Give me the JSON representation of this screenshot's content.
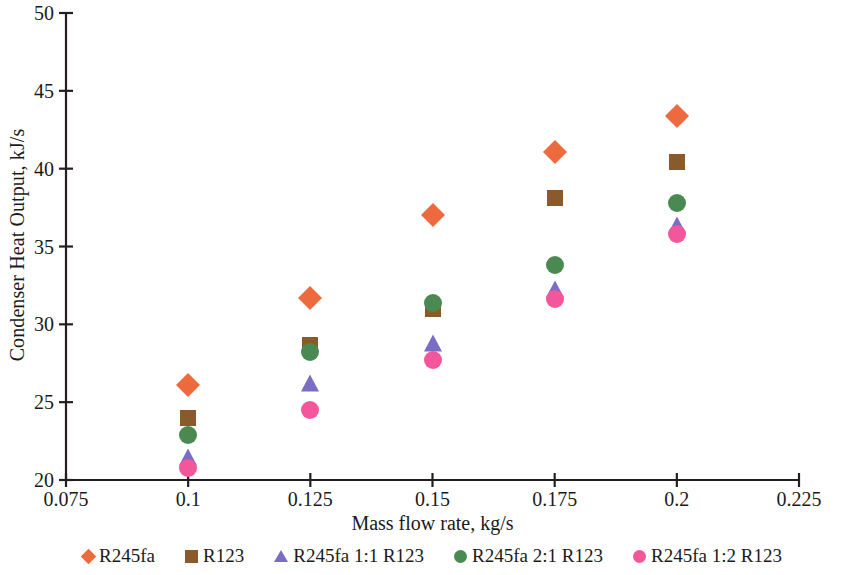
{
  "chart_data": {
    "type": "scatter",
    "title": "",
    "xlabel": "Mass flow rate, kg/s",
    "ylabel": "Condenser Heat Output, kJ/s",
    "xlim": [
      0.075,
      0.225
    ],
    "ylim": [
      20,
      50
    ],
    "xticks": [
      "0.075",
      "0.1",
      "0.125",
      "0.15",
      "0.175",
      "0.2",
      "0.225"
    ],
    "xtick_values": [
      0.075,
      0.1,
      0.125,
      0.15,
      0.175,
      0.2,
      0.225
    ],
    "yticks": [
      "50",
      "45",
      "40",
      "35",
      "30",
      "25",
      "20"
    ],
    "ytick_values": [
      50,
      45,
      40,
      35,
      30,
      25,
      20
    ],
    "grid": false,
    "legend_position": "bottom",
    "x": [
      0.1,
      0.125,
      0.15,
      0.175,
      0.2
    ],
    "series": [
      {
        "name": "R245fa",
        "marker": "diamond",
        "color": "#ED6A3F",
        "values": [
          26.1,
          31.7,
          37.0,
          41.1,
          43.4
        ]
      },
      {
        "name": "R123",
        "marker": "square",
        "color": "#8A5A2B",
        "values": [
          24.0,
          28.7,
          31.0,
          38.1,
          40.4
        ]
      },
      {
        "name": "R245fa 1:1 R123",
        "marker": "triangle",
        "color": "#7B6DC4",
        "values": [
          21.5,
          26.2,
          28.8,
          32.3,
          36.4
        ]
      },
      {
        "name": "R245fa 2:1 R123",
        "marker": "circle",
        "color": "#4A8A52",
        "values": [
          22.9,
          28.2,
          31.4,
          33.8,
          37.8
        ]
      },
      {
        "name": "R245fa 1:2 R123",
        "marker": "circle",
        "color": "#F4569C",
        "values": [
          20.8,
          24.5,
          27.7,
          31.6,
          35.8
        ]
      }
    ]
  },
  "axis": {
    "line_color": "#231f20"
  }
}
